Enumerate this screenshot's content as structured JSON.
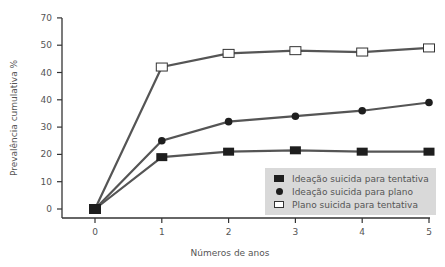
{
  "chart_data": {
    "type": "line",
    "title": "",
    "xlabel": "Números de anos",
    "ylabel": "Prevalência cumulativa %",
    "x": [
      0,
      1,
      2,
      3,
      4,
      5
    ],
    "x_tick_labels": [
      "0",
      "1",
      "2",
      "3",
      "4",
      "5"
    ],
    "y_tick_labels": [
      "0",
      "10",
      "20",
      "30",
      "40",
      "40",
      "50",
      "70"
    ],
    "ylim": [
      0,
      70
    ],
    "grid": false,
    "legend_position": "lower right",
    "series": [
      {
        "name": "Ideação suicida para tentativa",
        "marker": "filled-square",
        "values": [
          0,
          19,
          21,
          21.5,
          21,
          21
        ]
      },
      {
        "name": "Ideação suicida para plano",
        "marker": "filled-circle",
        "values": [
          0,
          25,
          32,
          34,
          36,
          39
        ]
      },
      {
        "name": "Plano suicida para tentativa",
        "marker": "open-square",
        "values": [
          0,
          42,
          47,
          48,
          47.5,
          49
        ]
      }
    ],
    "colors": {
      "line": "#555555",
      "marker": "#1e1e1e",
      "legend_bg": "#d9d9d9"
    }
  },
  "legend": {
    "items": [
      {
        "label": "Ideação suicida para tentativa"
      },
      {
        "label": "Ideação suicida para plano"
      },
      {
        "label": "Plano suicida para tentativa"
      }
    ]
  }
}
